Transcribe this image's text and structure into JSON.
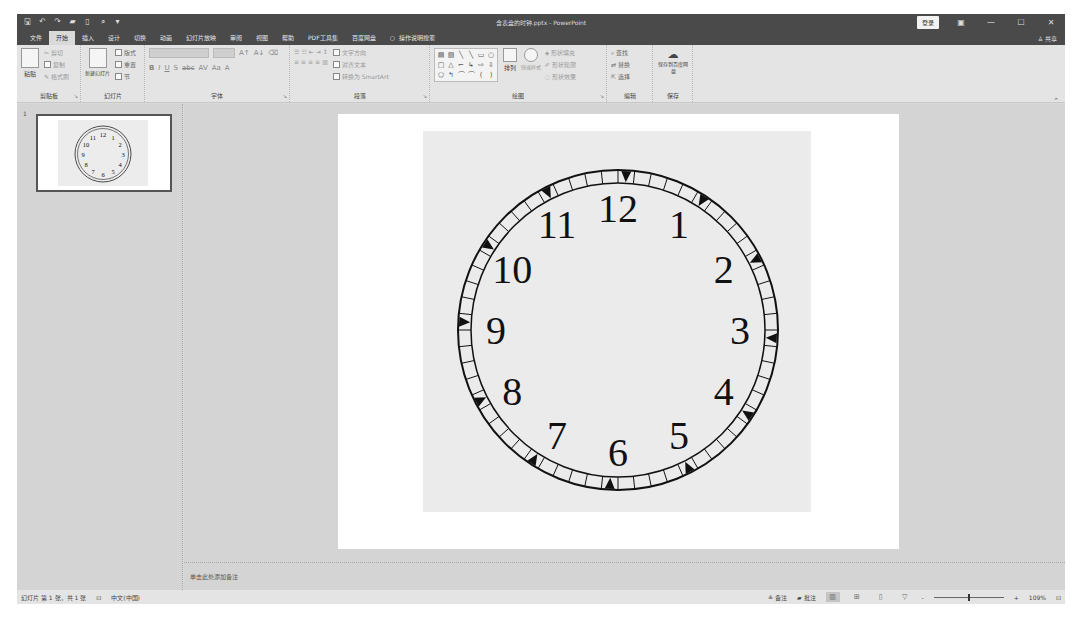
{
  "window": {
    "title": "含表盘的时钟.pptx - PowerPoint",
    "login_label": "登录",
    "share_label": "共享",
    "quick_access": [
      {
        "icon": "save-icon",
        "glyph": "🖫"
      },
      {
        "icon": "undo-icon",
        "glyph": "↶"
      },
      {
        "icon": "redo-icon",
        "glyph": "↷"
      },
      {
        "icon": "open-folder-icon",
        "glyph": "▰"
      },
      {
        "icon": "new-file-icon",
        "glyph": "▯"
      },
      {
        "icon": "print-preview-icon",
        "glyph": "⌕"
      },
      {
        "icon": "customize-qat-icon",
        "glyph": "▾"
      }
    ],
    "controls": {
      "ribbon_options": "▣",
      "minimize": "—",
      "maximize": "☐",
      "close": "✕"
    }
  },
  "tabs": [
    {
      "label": "文件",
      "active": false
    },
    {
      "label": "开始",
      "active": true
    },
    {
      "label": "插入",
      "active": false
    },
    {
      "label": "设计",
      "active": false
    },
    {
      "label": "切换",
      "active": false
    },
    {
      "label": "动画",
      "active": false
    },
    {
      "label": "幻灯片放映",
      "active": false
    },
    {
      "label": "审阅",
      "active": false
    },
    {
      "label": "视图",
      "active": false
    },
    {
      "label": "帮助",
      "active": false
    },
    {
      "label": "PDF工具集",
      "active": false
    },
    {
      "label": "百度网盘",
      "active": false
    }
  ],
  "tell_me": {
    "icon": "lightbulb-icon",
    "label": "操作说明搜索"
  },
  "ribbon": {
    "clipboard": {
      "label": "剪贴板",
      "paste": "粘贴",
      "cut": "剪切",
      "copy": "复制",
      "format_painter": "格式刷"
    },
    "slides": {
      "label": "幻灯片",
      "new_slide": "新建幻灯片",
      "layout": "版式",
      "reset": "重置",
      "section": "节"
    },
    "font": {
      "label": "字体",
      "font_name": "",
      "font_size": "",
      "buttons": [
        "A↑",
        "A↓",
        "⌫",
        "B",
        "I",
        "U",
        "S",
        "abc",
        "AV",
        "Aa",
        "A"
      ]
    },
    "paragraph": {
      "label": "段落",
      "text_direction": "文字方向",
      "align_text": "对齐文本",
      "smartart": "转换为 SmartArt"
    },
    "drawing": {
      "label": "绘图",
      "arrange": "排列",
      "quick_styles": "快速样式",
      "shape_fill": "形状填充",
      "shape_outline": "形状轮廓",
      "shape_effects": "形状效果",
      "shapes": [
        "▤",
        "▧",
        "╲",
        "╲",
        "▭",
        "○",
        "▢",
        "△",
        "⌐",
        "↳",
        "⇨",
        "⇩",
        "⬠",
        "↰",
        "⌒",
        "⌒",
        "(",
        ")"
      ]
    },
    "editing": {
      "label": "编辑",
      "find": "查找",
      "replace": "替换",
      "select": "选择"
    },
    "save": {
      "label": "保存",
      "save_to_baidu": "保存到百度网盘"
    }
  },
  "thumbnails": [
    {
      "number": "1",
      "selected": true
    }
  ],
  "slide": {
    "clock": {
      "numerals": [
        "12",
        "1",
        "2",
        "3",
        "4",
        "5",
        "6",
        "7",
        "8",
        "9",
        "10",
        "11"
      ],
      "minute_segments": 60,
      "hour_markers": "triangles"
    }
  },
  "notes": {
    "placeholder": "单击此处添加备注"
  },
  "status": {
    "slide_info": "幻灯片 第 1 张，共 1 张",
    "language": "中文(中国)",
    "notes_btn": "备注",
    "comments_btn": "批注",
    "zoom_level": "109%",
    "zoom_minus": "-",
    "zoom_plus": "+"
  }
}
